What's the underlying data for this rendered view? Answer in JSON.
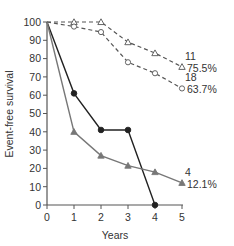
{
  "chart_data": {
    "type": "line",
    "title": "",
    "xlabel": "Years",
    "ylabel": "Event-free survival",
    "xlim": [
      0,
      5
    ],
    "ylim": [
      0,
      100
    ],
    "x_ticks": [
      0,
      1,
      2,
      3,
      4,
      5
    ],
    "y_ticks": [
      0,
      10,
      20,
      30,
      40,
      50,
      60,
      70,
      80,
      90,
      100
    ],
    "grid": false,
    "legend": null,
    "series": [
      {
        "name": "dashed-triangle",
        "style": "dashed",
        "marker": "open-triangle",
        "color": "#555555",
        "x": [
          0,
          1,
          2,
          3,
          4,
          5
        ],
        "values": [
          100,
          100,
          100,
          89,
          83,
          75.5
        ],
        "end_label_n": "11",
        "end_label_pct": "75.5%"
      },
      {
        "name": "dashed-circle",
        "style": "dashed",
        "marker": "open-circle",
        "color": "#555555",
        "x": [
          0,
          1,
          2,
          3,
          4,
          5
        ],
        "values": [
          100,
          97.5,
          94.5,
          78,
          72,
          63.7
        ],
        "end_label_n": "18",
        "end_label_pct": "63.7%"
      },
      {
        "name": "solid-black-circle",
        "style": "solid",
        "marker": "filled-circle",
        "color": "#222222",
        "x": [
          0,
          1,
          2,
          3,
          4
        ],
        "values": [
          100,
          61,
          41,
          41,
          0
        ],
        "end_label_n": "",
        "end_label_pct": ""
      },
      {
        "name": "solid-grey-triangle",
        "style": "solid",
        "marker": "filled-triangle",
        "color": "#777777",
        "x": [
          0,
          1,
          2,
          3,
          4,
          5
        ],
        "values": [
          100,
          40,
          27,
          21.5,
          18,
          12.1
        ],
        "end_label_n": "4",
        "end_label_pct": "12.1%"
      }
    ]
  }
}
